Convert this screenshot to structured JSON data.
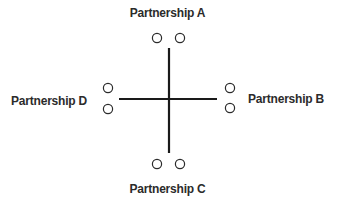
{
  "diagram": {
    "type": "cross-with-seats",
    "partnerships": [
      {
        "id": "A",
        "label": "Partnership A",
        "position": "top",
        "seats": 2
      },
      {
        "id": "B",
        "label": "Partnership B",
        "position": "right",
        "seats": 2
      },
      {
        "id": "C",
        "label": "Partnership C",
        "position": "bottom",
        "seats": 2
      },
      {
        "id": "D",
        "label": "Partnership D",
        "position": "left",
        "seats": 2
      }
    ],
    "colors": {
      "line": "#1a1a1a",
      "seat_stroke": "#2b2b2b",
      "text": "#2b2b2b",
      "background": "#ffffff"
    }
  }
}
